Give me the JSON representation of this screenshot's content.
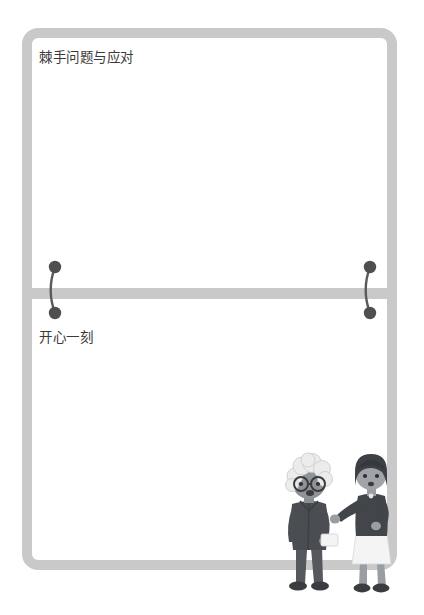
{
  "page": {
    "background_color": "#ffffff",
    "frame_color": "#c9c9c9",
    "text_color": "#3a3a3a"
  },
  "notebook": {
    "sections": [
      {
        "id": "tricky-questions",
        "label": "棘手问题与应对",
        "content": ""
      },
      {
        "id": "happy-moment",
        "label": "开心一刻",
        "content": ""
      }
    ],
    "binding": {
      "ring_color": "#5a5a5a",
      "ring_count": 2,
      "positions": [
        "left",
        "right"
      ]
    }
  },
  "illustration": {
    "name": "two-women-conversation",
    "figures": [
      {
        "id": "elderly-woman",
        "hair_color": "#e8e8e8",
        "clothing_color": "#4a4a4a",
        "accessory": "round-glasses",
        "holding": "white-card"
      },
      {
        "id": "young-woman",
        "hair_color": "#3d3d3d",
        "top_color": "#4a4a4a",
        "skirt_color": "#f2f2f2",
        "pose": "extended-arm"
      }
    ]
  }
}
